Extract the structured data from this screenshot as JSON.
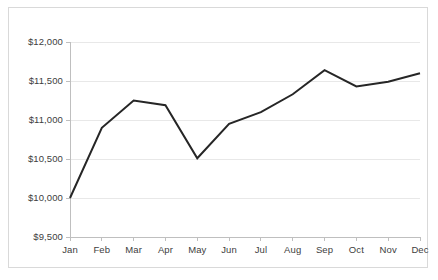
{
  "chart_data": {
    "type": "line",
    "title": "",
    "subtitle": "",
    "xlabel": "",
    "ylabel": "",
    "categories": [
      "Jan",
      "Feb",
      "Mar",
      "Apr",
      "May",
      "Jun",
      "Jul",
      "Aug",
      "Sep",
      "Oct",
      "Nov",
      "Dec"
    ],
    "series": [
      {
        "name": "Balance",
        "values": [
          10000,
          10900,
          11250,
          11190,
          10510,
          10950,
          11100,
          11330,
          11640,
          11430,
          11490,
          11600
        ]
      }
    ],
    "ylim": [
      9500,
      12000
    ],
    "ytick_step": 500,
    "ytick_values": [
      9500,
      10000,
      10500,
      11000,
      11500,
      12000
    ],
    "ytick_labels": [
      "$9,500",
      "$10,000",
      "$10,500",
      "$11,000",
      "$11,500",
      "$12,000"
    ],
    "xtick_labels": [
      "Jan",
      "Feb",
      "Mar",
      "Apr",
      "May",
      "Jun",
      "Jul",
      "Aug",
      "Sep",
      "Oct",
      "Nov",
      "Dec"
    ],
    "grid": "horizontal",
    "legend": "none",
    "annotations": [],
    "colors": {
      "line": "#262626",
      "gridline": "#e8e8e8",
      "axis": "#bfbfbf",
      "border": "#d9d9d9",
      "text": "#404040",
      "background": "#ffffff"
    },
    "line_width": 2
  }
}
